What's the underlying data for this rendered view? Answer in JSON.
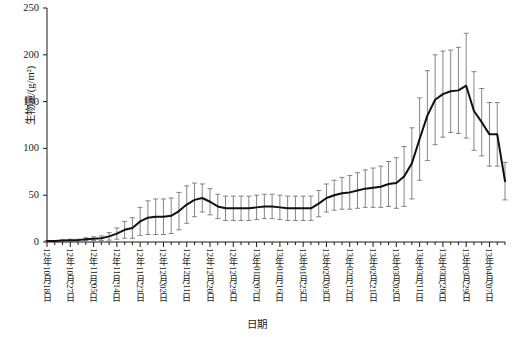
{
  "chart_data": {
    "type": "line",
    "title": "",
    "xlabel": "日期",
    "ylabel": "生物量/(g/m²)",
    "ylim": [
      0,
      250
    ],
    "yticks": [
      0,
      50,
      100,
      150,
      200,
      250
    ],
    "grid": false,
    "legend": null,
    "error_bars": true,
    "error_bar_style": "symmetric-capped",
    "axis_style": "left-and-bottom-spines",
    "line_color": "#111111",
    "errorbar_color": "#777777",
    "x_tick_labels": [
      "12年10月18日",
      "12年10月27日",
      "12年11月05日",
      "12年11月14日",
      "12年11月23日",
      "12年12月02日",
      "12年12月11日",
      "12年12月20日",
      "12年12月29日",
      "13年01月07日",
      "13年01月16日",
      "13年01月25日",
      "13年02月03日",
      "13年02月12日",
      "13年02月21日",
      "13年03月02日",
      "13年03月11日",
      "13年03月20日",
      "13年03月29日",
      "13年04月07日",
      "13年04月16日",
      "13年04月25日"
    ],
    "x_tick_every_n_points": 3,
    "values": [
      1,
      1,
      1.5,
      2,
      2,
      3,
      3.5,
      4,
      6,
      9,
      13,
      15,
      22,
      26,
      27,
      27,
      28,
      33,
      40,
      45,
      47,
      43,
      38,
      36,
      36,
      36,
      36,
      37,
      38,
      38,
      37,
      36,
      36,
      36,
      36,
      41,
      47,
      50,
      52,
      53,
      55,
      57,
      58,
      59,
      62,
      63,
      70,
      84,
      110,
      135,
      152,
      158,
      161,
      162,
      167,
      140,
      128,
      115,
      115,
      65
    ],
    "errors": [
      0.5,
      0.5,
      0.8,
      1,
      1,
      1.5,
      2,
      2.5,
      4,
      6,
      9,
      11,
      15,
      18,
      19,
      19,
      19,
      20,
      20,
      18,
      15,
      14,
      13,
      13,
      13,
      13,
      13,
      13,
      13,
      13,
      13,
      13,
      13,
      13,
      13,
      14,
      15,
      16,
      17,
      18,
      19,
      20,
      21,
      22,
      24,
      27,
      32,
      38,
      44,
      48,
      48,
      46,
      44,
      46,
      56,
      42,
      36,
      34,
      34,
      20
    ]
  }
}
